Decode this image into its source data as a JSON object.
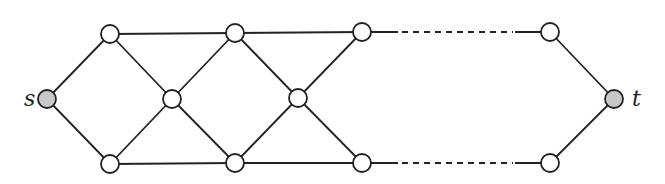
{
  "diagram": {
    "type": "graph",
    "colors": {
      "stroke": "#222222",
      "node_fill": "#ffffff",
      "terminal_fill": "#c8c8c8",
      "background": "#ffffff"
    },
    "node_radius": 9,
    "nodes": [
      {
        "id": "s",
        "x": 47,
        "y": 99,
        "terminal": true,
        "label": "s",
        "label_x": 24,
        "label_y": 106
      },
      {
        "id": "a1",
        "x": 110,
        "y": 34
      },
      {
        "id": "b1",
        "x": 110,
        "y": 164
      },
      {
        "id": "m1",
        "x": 172,
        "y": 99
      },
      {
        "id": "a2",
        "x": 235,
        "y": 33
      },
      {
        "id": "b2",
        "x": 235,
        "y": 163
      },
      {
        "id": "m2",
        "x": 298,
        "y": 98
      },
      {
        "id": "a3",
        "x": 362,
        "y": 32
      },
      {
        "id": "b3",
        "x": 362,
        "y": 163
      },
      {
        "id": "ak",
        "x": 550,
        "y": 32
      },
      {
        "id": "bk",
        "x": 550,
        "y": 163
      },
      {
        "id": "t",
        "x": 614,
        "y": 99,
        "terminal": true,
        "label": "t",
        "label_x": 632,
        "label_y": 106
      }
    ],
    "edges": [
      {
        "from": "s",
        "to": "a1"
      },
      {
        "from": "s",
        "to": "b1"
      },
      {
        "from": "a1",
        "to": "a2"
      },
      {
        "from": "b1",
        "to": "b2"
      },
      {
        "from": "a1",
        "to": "m1"
      },
      {
        "from": "b1",
        "to": "m1"
      },
      {
        "from": "m1",
        "to": "a2"
      },
      {
        "from": "m1",
        "to": "b2"
      },
      {
        "from": "a2",
        "to": "a3"
      },
      {
        "from": "b2",
        "to": "b3"
      },
      {
        "from": "a2",
        "to": "m2"
      },
      {
        "from": "b2",
        "to": "m2"
      },
      {
        "from": "m2",
        "to": "a3"
      },
      {
        "from": "m2",
        "to": "b3"
      },
      {
        "from": "ak",
        "to": "t"
      },
      {
        "from": "bk",
        "to": "t"
      }
    ],
    "ellipsis_paths": [
      {
        "from": "a3",
        "to": "ak",
        "solid_end_left": 398,
        "dash_start": 398,
        "dash_end": 515,
        "y": 32
      },
      {
        "from": "b3",
        "to": "bk",
        "solid_end_left": 398,
        "dash_start": 398,
        "dash_end": 515,
        "y": 163
      }
    ]
  }
}
